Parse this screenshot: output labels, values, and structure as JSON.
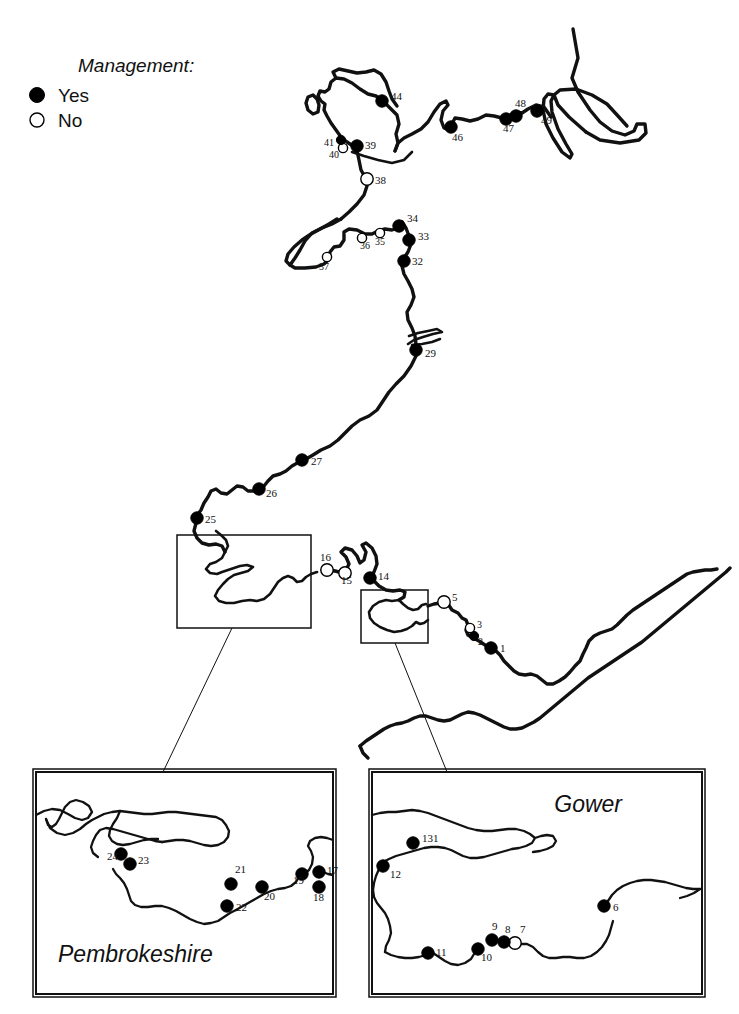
{
  "figure": {
    "kind": "coastline-site-map",
    "region": "Wales coastline",
    "background_color": "#ffffff",
    "line_color": "#111111"
  },
  "legend": {
    "title": "Management:",
    "items": [
      {
        "label": "Yes",
        "symbol": "filled-circle",
        "fill": "#000000"
      },
      {
        "label": "No",
        "symbol": "open-circle",
        "fill": "#ffffff"
      }
    ]
  },
  "insets": [
    {
      "id": "pembrokeshire",
      "title": "Pembrokeshire",
      "title_x": 58,
      "title_y": 962,
      "box": {
        "x": 36,
        "y": 772,
        "w": 297,
        "h": 222
      }
    },
    {
      "id": "gower",
      "title": "Gower",
      "title_x": 622,
      "title_y": 812,
      "box": {
        "x": 372,
        "y": 772,
        "w": 330,
        "h": 222
      }
    }
  ],
  "locator_boxes": [
    {
      "id": "pembrokeshire-locator",
      "x": 177,
      "y": 535,
      "w": 134,
      "h": 93
    },
    {
      "id": "gower-locator",
      "x": 361,
      "y": 590,
      "w": 67,
      "h": 53
    }
  ],
  "leader_lines": [
    {
      "id": "pembrokeshire-leader",
      "x1": 232,
      "y1": 628,
      "x2": 163,
      "y2": 772
    },
    {
      "id": "gower-leader",
      "x1": 395,
      "y1": 643,
      "x2": 447,
      "y2": 772
    }
  ],
  "sites": {
    "main": [
      {
        "label": "1",
        "x": 491,
        "y": 648,
        "management": "Yes",
        "lx": 500,
        "ly": 652
      },
      {
        "label": "2",
        "x": 474,
        "y": 636,
        "management": "Yes",
        "lx": 478,
        "ly": 645,
        "small": true
      },
      {
        "label": "3",
        "x": 470,
        "y": 628,
        "management": "No",
        "lx": 477,
        "ly": 628,
        "small": true
      },
      {
        "label": "5",
        "x": 444,
        "y": 602,
        "management": "No",
        "lx": 452,
        "ly": 601
      },
      {
        "label": "14",
        "x": 370,
        "y": 578,
        "management": "Yes",
        "lx": 378,
        "ly": 580
      },
      {
        "label": "15",
        "x": 345,
        "y": 573,
        "management": "No",
        "lx": 341,
        "ly": 584
      },
      {
        "label": "16",
        "x": 327,
        "y": 570,
        "management": "No",
        "lx": 320,
        "ly": 561
      },
      {
        "label": "25",
        "x": 197,
        "y": 518,
        "management": "Yes",
        "lx": 205,
        "ly": 523
      },
      {
        "label": "26",
        "x": 259,
        "y": 489,
        "management": "Yes",
        "lx": 266,
        "ly": 497
      },
      {
        "label": "27",
        "x": 302,
        "y": 460,
        "management": "Yes",
        "lx": 311,
        "ly": 465
      },
      {
        "label": "29",
        "x": 416,
        "y": 350,
        "management": "Yes",
        "lx": 425,
        "ly": 357
      },
      {
        "label": "32",
        "x": 404,
        "y": 261,
        "management": "Yes",
        "lx": 412,
        "ly": 265
      },
      {
        "label": "33",
        "x": 409,
        "y": 240,
        "management": "Yes",
        "lx": 418,
        "ly": 240
      },
      {
        "label": "34",
        "x": 399,
        "y": 226,
        "management": "Yes",
        "lx": 407,
        "ly": 222
      },
      {
        "label": "35",
        "x": 380,
        "y": 233,
        "management": "No",
        "lx": 375,
        "ly": 245,
        "small": true
      },
      {
        "label": "36",
        "x": 362,
        "y": 238,
        "management": "No",
        "lx": 360,
        "ly": 249,
        "small": true
      },
      {
        "label": "37",
        "x": 327,
        "y": 257,
        "management": "No",
        "lx": 319,
        "ly": 270,
        "small": true
      },
      {
        "label": "38",
        "x": 367,
        "y": 179,
        "management": "No",
        "lx": 375,
        "ly": 184
      },
      {
        "label": "39",
        "x": 357,
        "y": 146,
        "management": "Yes",
        "lx": 365,
        "ly": 149
      },
      {
        "label": "40",
        "x": 343,
        "y": 148,
        "management": "No",
        "lx": 329,
        "ly": 158,
        "small": true
      },
      {
        "label": "41",
        "x": 341,
        "y": 140,
        "management": "Yes",
        "lx": 324,
        "ly": 146,
        "small": true
      },
      {
        "label": "44",
        "x": 382,
        "y": 101,
        "management": "Yes",
        "lx": 391,
        "ly": 100
      },
      {
        "label": "46",
        "x": 451,
        "y": 127,
        "management": "Yes",
        "lx": 452,
        "ly": 141
      },
      {
        "label": "47",
        "x": 506,
        "y": 119,
        "management": "Yes",
        "lx": 503,
        "ly": 132
      },
      {
        "label": "48",
        "x": 516,
        "y": 116,
        "management": "Yes",
        "lx": 515,
        "ly": 107
      },
      {
        "label": "49",
        "x": 537,
        "y": 111,
        "management": "Yes",
        "lx": 541,
        "ly": 124
      }
    ],
    "pembrokeshire": [
      {
        "label": "17",
        "x": 319,
        "y": 872,
        "management": "Yes",
        "lx": 327,
        "ly": 874
      },
      {
        "label": "18",
        "x": 319,
        "y": 887,
        "management": "Yes",
        "lx": 313,
        "ly": 901
      },
      {
        "label": "19",
        "x": 302,
        "y": 874,
        "management": "Yes",
        "lx": 293,
        "ly": 884
      },
      {
        "label": "20",
        "x": 262,
        "y": 887,
        "management": "Yes",
        "lx": 264,
        "ly": 900
      },
      {
        "label": "21",
        "x": 231,
        "y": 884,
        "management": "Yes",
        "lx": 235,
        "ly": 873
      },
      {
        "label": "22",
        "x": 227,
        "y": 906,
        "management": "Yes",
        "lx": 236,
        "ly": 911
      },
      {
        "label": "23",
        "x": 130,
        "y": 864,
        "management": "Yes",
        "lx": 138,
        "ly": 864
      },
      {
        "label": "24",
        "x": 121,
        "y": 854,
        "management": "Yes",
        "lx": 107,
        "ly": 860
      }
    ],
    "gower": [
      {
        "label": "6",
        "x": 604,
        "y": 906,
        "management": "Yes",
        "lx": 613,
        "ly": 911
      },
      {
        "label": "7",
        "x": 515,
        "y": 943,
        "management": "No",
        "lx": 520,
        "ly": 933
      },
      {
        "label": "8",
        "x": 504,
        "y": 942,
        "management": "Yes",
        "lx": 505,
        "ly": 933
      },
      {
        "label": "9",
        "x": 492,
        "y": 940,
        "management": "Yes",
        "lx": 492,
        "ly": 930
      },
      {
        "label": "10",
        "x": 478,
        "y": 949,
        "management": "Yes",
        "lx": 481,
        "ly": 961
      },
      {
        "label": "11",
        "x": 428,
        "y": 953,
        "management": "Yes",
        "lx": 436,
        "ly": 956
      },
      {
        "label": "12",
        "x": 383,
        "y": 866,
        "management": "Yes",
        "lx": 390,
        "ly": 878
      },
      {
        "label": "131",
        "x": 413,
        "y": 843,
        "management": "Yes",
        "lx": 422,
        "ly": 842
      }
    ]
  }
}
